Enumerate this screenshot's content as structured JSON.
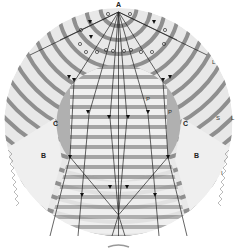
{
  "diagram": {
    "type": "wave-ray-diagram",
    "colors": {
      "background": "#ffffff",
      "outer_disc": "#e6e6e6",
      "wave_band_light": "#f2f2f2",
      "wave_band_dark": "#9a9a9a",
      "core_circle": "#a8a8a8",
      "shadow_zone": "#eeeeee",
      "ray_line": "#222222"
    },
    "labels": {
      "source": "A",
      "core_left": "C",
      "core_right": "C",
      "shadow_left": "B",
      "shadow_right": "B",
      "rim_upper_right": "L",
      "rim_right": "L",
      "rim_s": "S",
      "rim_lower_right": "I",
      "inner_p_upper": "P",
      "inner_p_lower": "P"
    }
  }
}
